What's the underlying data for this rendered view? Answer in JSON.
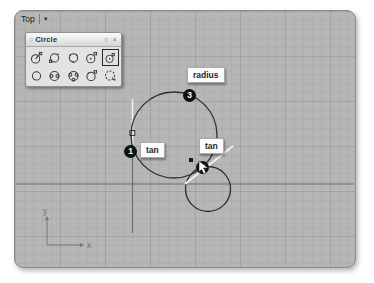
{
  "viewport": {
    "title": "Top",
    "dropdown_icon": "▾"
  },
  "toolbar": {
    "title": "Circle",
    "grip_icon": "○",
    "options_icon": "○",
    "close_icon": "×",
    "icons": [
      {
        "name": "circle-center-radius",
        "selected": false
      },
      {
        "name": "circle-2-points",
        "selected": false
      },
      {
        "name": "circle-3-points",
        "selected": false
      },
      {
        "name": "circle-diameter",
        "selected": false
      },
      {
        "name": "circle-tangent-tangent-radius",
        "selected": true
      },
      {
        "name": "circle-vertical",
        "selected": false
      },
      {
        "name": "circle-tangent-to-2-curves",
        "selected": false
      },
      {
        "name": "circle-tangent-to-3-curves",
        "selected": false
      },
      {
        "name": "circle-fit-points",
        "selected": false
      },
      {
        "name": "circle-sketch",
        "selected": false
      }
    ]
  },
  "annotations": {
    "snap_labels": [
      {
        "id": "radius-label",
        "text": "radius"
      },
      {
        "id": "tan-label-on-line",
        "text": "tan"
      },
      {
        "id": "tan-label-on-circle",
        "text": "tan"
      }
    ],
    "step_markers": [
      {
        "id": "step-1",
        "number": "1"
      },
      {
        "id": "step-2",
        "number": "2"
      },
      {
        "id": "step-3",
        "number": "3"
      }
    ]
  },
  "axis_icon": {
    "y_label": "y",
    "x_label": "x"
  },
  "geometry": {
    "large_circle": {
      "cx": 174,
      "cy": 135,
      "r": 43
    },
    "small_circle": {
      "cx": 208,
      "cy": 189,
      "r": 22.5
    },
    "vertical_line": {
      "x": 132.5,
      "y_top": 99,
      "y_bottom": 233
    },
    "x_axis_line_y": 184
  },
  "colors": {
    "viewport_bg": "#b6b6b6",
    "grid_minor": "#a9a9a9",
    "grid_major": "#9c9c9c",
    "axis_line": "#6d6d6d",
    "curve": "#2f2f2f",
    "highlight_line": "#f1f1f1",
    "marker_bg": "#101010",
    "marker_text": "#ffffff",
    "label_bg": "#fcfcfc"
  }
}
